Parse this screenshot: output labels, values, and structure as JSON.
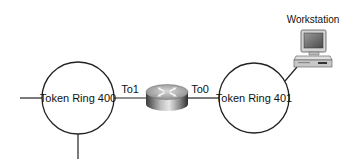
{
  "diagram": {
    "type": "network-topology",
    "nodes": {
      "ring_left": {
        "label": "Token Ring 400"
      },
      "ring_right": {
        "label": "Token Ring 401"
      },
      "router": {
        "label": ""
      },
      "workstation": {
        "label": "Workstation"
      }
    },
    "interfaces": {
      "router_left": "To1",
      "router_right": "To0"
    },
    "edges": [
      {
        "from": "router",
        "to": "ring_left",
        "interface": "To1"
      },
      {
        "from": "router",
        "to": "ring_right",
        "interface": "To0"
      },
      {
        "from": "ring_right",
        "to": "workstation"
      }
    ],
    "colors": {
      "line": "#222222",
      "background": "#ffffff"
    }
  }
}
